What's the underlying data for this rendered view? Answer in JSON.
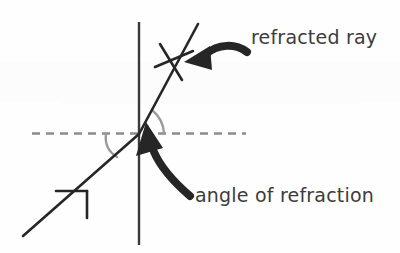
{
  "figure": {
    "type": "physics-ray-diagram",
    "topic": "refraction of light at a boundary",
    "background_color": "#fefefe",
    "ink_color": "#262626",
    "text_color": "#3c3c3c",
    "arc_color": "#9a9a9a",
    "normal_line_color": "#3a3a3a",
    "boundary_line_color": "#8c8c8c"
  },
  "labels": {
    "refracted_ray": "refracted ray",
    "angle_of_refraction": "angle of refraction"
  },
  "elements": {
    "normal_line_name": "normal",
    "boundary_line_name": "boundary surface",
    "incident_ray_name": "incident ray",
    "refracted_ray_name": "refracted ray",
    "angle_arc_upper_name": "angle of refraction arc",
    "angle_arc_lower_name": "angle of incidence arc",
    "pointer_upper_name": "pointer to refracted ray",
    "pointer_lower_name": "pointer to angle of refraction"
  },
  "geometry": {
    "intersection_point": [
      139,
      134
    ],
    "normal_line": {
      "x": 139,
      "y_top": 22,
      "y_bottom": 245
    },
    "boundary_dashed_line": {
      "y": 133,
      "x_start": 32,
      "x_end": 246,
      "dash": "8 6"
    },
    "incident_ray": {
      "x1": 23,
      "y1": 236,
      "x2": 139,
      "y2": 134
    },
    "refracted_ray": {
      "x1": 139,
      "y1": 134,
      "x2": 198,
      "y2": 24
    }
  }
}
